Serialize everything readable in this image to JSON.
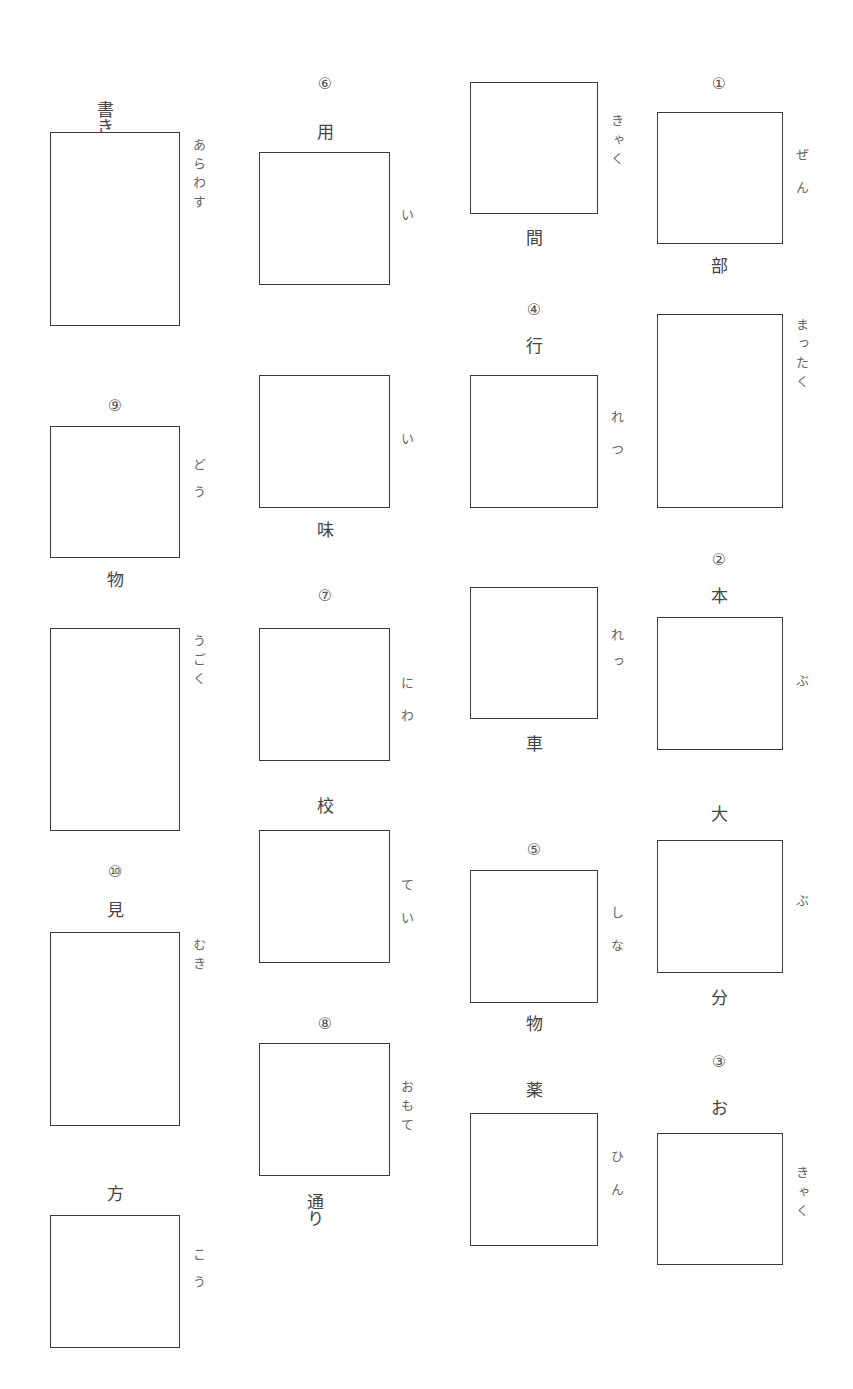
{
  "worksheet": {
    "items": [
      {
        "id": "kakiarawasu",
        "number": "",
        "above": "書き",
        "below": "",
        "reading": "あらわす"
      },
      {
        "id": "youi",
        "number": "⑥",
        "above": "用",
        "below": "",
        "reading": "い"
      },
      {
        "id": "ikyakukan",
        "number": "",
        "above": "",
        "below": "間",
        "reading": "きゃく"
      },
      {
        "id": "zenbu",
        "number": "①",
        "above": "",
        "below": "部",
        "reading": "ぜん"
      },
      {
        "id": "mattaku",
        "number": "",
        "above": "",
        "below": "",
        "reading": "まったく"
      },
      {
        "id": "gyouretsu",
        "number": "④",
        "above": "行",
        "below": "",
        "reading": "れつ"
      },
      {
        "id": "imi",
        "number": "",
        "above": "",
        "below": "味",
        "reading": "い"
      },
      {
        "id": "doubutsu",
        "number": "⑨",
        "above": "",
        "below": "物",
        "reading": "どう"
      },
      {
        "id": "ugoku",
        "number": "",
        "above": "",
        "below": "",
        "reading": "うごく"
      },
      {
        "id": "niwa",
        "number": "⑦",
        "above": "",
        "below": "",
        "reading": "にわ"
      },
      {
        "id": "ressha",
        "number": "",
        "above": "",
        "below": "車",
        "reading": "れっ"
      },
      {
        "id": "honbu",
        "number": "②",
        "above": "本",
        "below": "",
        "reading": "ぶ"
      },
      {
        "id": "koutei",
        "number": "",
        "above": "校",
        "below": "",
        "reading": "てい"
      },
      {
        "id": "daibubun",
        "number": "",
        "above": "大",
        "below": "分",
        "reading": "ぶ"
      },
      {
        "id": "shinamono",
        "number": "⑤",
        "above": "",
        "below": "物",
        "reading": "しな"
      },
      {
        "id": "mikimuki",
        "number": "⑩",
        "above": "見",
        "below": "",
        "reading": "むき"
      },
      {
        "id": "omotedoori",
        "number": "⑧",
        "above": "",
        "below": "通り",
        "reading": "おもて"
      },
      {
        "id": "yakuhin",
        "number": "",
        "above": "薬",
        "below": "",
        "reading": "ひん"
      },
      {
        "id": "okyaku",
        "number": "③",
        "above": "お",
        "below": "",
        "reading": "きゃく"
      },
      {
        "id": "houkou",
        "number": "",
        "above": "方",
        "below": "",
        "reading": "こう"
      }
    ]
  }
}
